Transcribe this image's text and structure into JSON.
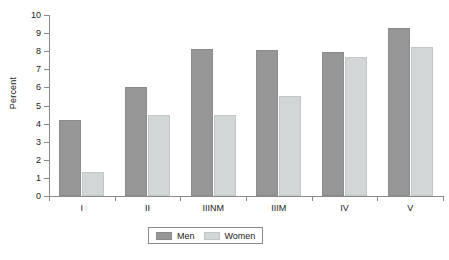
{
  "chart_data": {
    "type": "bar",
    "title": "",
    "subtitle": "",
    "xlabel": "",
    "ylabel": "Percent",
    "categories": [
      "I",
      "II",
      "IIINM",
      "IIIM",
      "IV",
      "V"
    ],
    "series": [
      {
        "name": "Men",
        "color": "#969696",
        "values": [
          4.2,
          6.05,
          8.1,
          8.05,
          7.95,
          9.3
        ]
      },
      {
        "name": "Women",
        "color": "#d2d6d6",
        "values": [
          1.35,
          4.45,
          4.45,
          5.5,
          7.7,
          8.25
        ]
      }
    ],
    "ylim": [
      0,
      10
    ],
    "ytick_values": [
      0,
      1,
      2,
      3,
      4,
      5,
      6,
      7,
      8,
      9,
      10
    ],
    "ytick_labels": [
      "0",
      "1",
      "2",
      "3",
      "4",
      "5",
      "6",
      "7",
      "8",
      "9",
      "10"
    ],
    "grid": false,
    "legend_position": "bottom-center",
    "legend_entries": [
      "Men",
      "Women"
    ],
    "annotations": []
  },
  "axes": {
    "y_label": "Percent"
  },
  "legend": {
    "entries": [
      {
        "label": "Men"
      },
      {
        "label": "Women"
      }
    ]
  },
  "caption": {
    "partial_text": ""
  }
}
